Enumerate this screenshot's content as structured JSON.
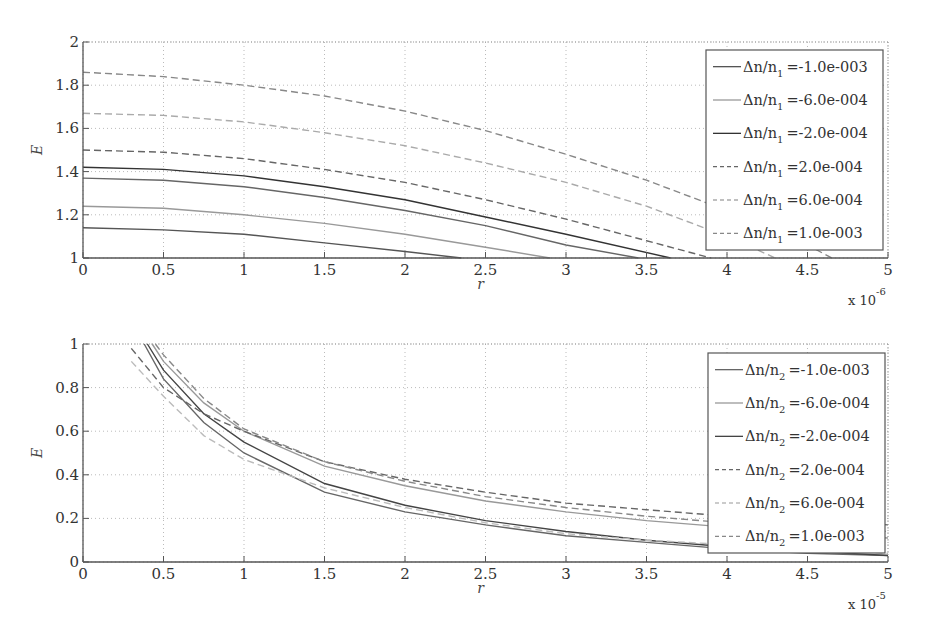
{
  "chart_data": [
    {
      "type": "line",
      "title": "",
      "xlabel": "r",
      "ylabel": "E",
      "x_multiplier": "x 10^-6",
      "x_multiplier_base": "x 10",
      "x_multiplier_exp": "-6",
      "xlim": [
        0,
        5
      ],
      "ylim": [
        1,
        2
      ],
      "xticks": [
        "0",
        "0.5",
        "1",
        "1.5",
        "2",
        "2.5",
        "3",
        "3.5",
        "4",
        "4.5",
        "5"
      ],
      "yticks": [
        "1",
        "1.2",
        "1.4",
        "1.6",
        "1.8",
        "2"
      ],
      "grid": true,
      "legend_position": "upper right",
      "series": [
        {
          "name": "Δn/n1 =-1.0e-003",
          "legend_prefix": "Δn/n",
          "legend_sub": "1",
          "legend_value": "=-1.0e-003",
          "style": "solid",
          "color": "#555555",
          "x": [
            0,
            0.5,
            1,
            1.5,
            2,
            2.35
          ],
          "y": [
            1.14,
            1.13,
            1.11,
            1.07,
            1.03,
            1.0
          ]
        },
        {
          "name": "Δn/n1 =-6.0e-004",
          "legend_prefix": "Δn/n",
          "legend_sub": "1",
          "legend_value": "=-6.0e-004",
          "style": "solid",
          "color": "#999999",
          "x": [
            0,
            0.5,
            1,
            1.5,
            2,
            2.5,
            2.9
          ],
          "y": [
            1.24,
            1.23,
            1.2,
            1.16,
            1.11,
            1.05,
            1.0
          ]
        },
        {
          "name": "Δn/n1 =-2.0e-004",
          "legend_prefix": "Δn/n",
          "legend_sub": "1",
          "legend_value": "=-2.0e-004",
          "style": "solid",
          "color": "#333333",
          "x": [
            0,
            0.5,
            1,
            1.5,
            2,
            2.5,
            3,
            3.65
          ],
          "y": [
            1.42,
            1.41,
            1.38,
            1.33,
            1.27,
            1.19,
            1.11,
            1.0
          ]
        },
        {
          "name": "Δn/n1 =2.0e-004",
          "legend_prefix": "Δn/n",
          "legend_sub": "1",
          "legend_value": "=2.0e-004",
          "style": "dashed",
          "color": "#666666",
          "x": [
            0,
            0.5,
            1,
            1.5,
            2,
            2.5,
            3,
            3.5,
            3.9
          ],
          "y": [
            1.5,
            1.49,
            1.46,
            1.41,
            1.35,
            1.27,
            1.18,
            1.08,
            1.0
          ]
        },
        {
          "name": "Δn/n1 =6.0e-004",
          "legend_prefix": "Δn/n",
          "legend_sub": "1",
          "legend_value": "=6.0e-004",
          "style": "dashed",
          "color": "#aaaaaa",
          "x": [
            0,
            0.5,
            1,
            1.5,
            2,
            2.5,
            3,
            3.5,
            4,
            4.3
          ],
          "y": [
            1.67,
            1.66,
            1.63,
            1.58,
            1.52,
            1.44,
            1.35,
            1.24,
            1.1,
            1.0
          ]
        },
        {
          "name": "Δn/n1 =1.0e-003",
          "legend_prefix": "Δn/n",
          "legend_sub": "1",
          "legend_value": "=1.0e-003",
          "style": "dashed",
          "color": "#888888",
          "x": [
            0,
            0.5,
            1,
            1.5,
            2,
            2.5,
            3,
            3.5,
            4,
            4.5,
            4.65
          ],
          "y": [
            1.86,
            1.84,
            1.8,
            1.75,
            1.68,
            1.59,
            1.48,
            1.36,
            1.22,
            1.06,
            1.0
          ]
        }
      ],
      "extra_unlabeled_series": [
        {
          "style": "solid",
          "color": "#666666",
          "x": [
            0,
            0.5,
            1,
            1.5,
            2,
            2.5,
            3,
            3.45
          ],
          "y": [
            1.37,
            1.36,
            1.33,
            1.28,
            1.22,
            1.15,
            1.06,
            1.0
          ]
        }
      ]
    },
    {
      "type": "line",
      "title": "",
      "xlabel": "r",
      "ylabel": "E",
      "x_multiplier": "x 10^-5",
      "x_multiplier_base": "x 10",
      "x_multiplier_exp": "-5",
      "xlim": [
        0,
        5
      ],
      "ylim": [
        0,
        1
      ],
      "xticks": [
        "0",
        "0.5",
        "1",
        "1.5",
        "2",
        "2.5",
        "3",
        "3.5",
        "4",
        "4.5",
        "5"
      ],
      "yticks": [
        "0",
        "0.2",
        "0.4",
        "0.6",
        "0.8",
        "1"
      ],
      "grid": true,
      "legend_position": "lower right",
      "series": [
        {
          "name": "Δn/n2 =-1.0e-003",
          "legend_prefix": "Δn/n",
          "legend_sub": "2",
          "legend_value": "=-1.0e-003",
          "style": "solid",
          "color": "#666666",
          "x": [
            0.38,
            0.5,
            0.75,
            1,
            1.5,
            2,
            2.5,
            3,
            3.5,
            4,
            4.5,
            5
          ],
          "y": [
            1.0,
            0.84,
            0.64,
            0.5,
            0.32,
            0.23,
            0.17,
            0.12,
            0.09,
            0.06,
            0.04,
            0.03
          ]
        },
        {
          "name": "Δn/n2 =-6.0e-004",
          "legend_prefix": "Δn/n",
          "legend_sub": "2",
          "legend_value": "=-6.0e-004",
          "style": "solid",
          "color": "#999999",
          "x": [
            0.43,
            0.5,
            0.75,
            1,
            1.5,
            2,
            2.5,
            3,
            3.5,
            4,
            4.5,
            5
          ],
          "y": [
            1.0,
            0.92,
            0.73,
            0.6,
            0.44,
            0.35,
            0.28,
            0.23,
            0.19,
            0.16,
            0.13,
            0.11
          ]
        },
        {
          "name": "Δn/n2 =-2.0e-004",
          "legend_prefix": "Δn/n",
          "legend_sub": "2",
          "legend_value": "=-2.0e-004",
          "style": "solid",
          "color": "#444444",
          "x": [
            0.4,
            0.5,
            0.75,
            1,
            1.5,
            2,
            2.5,
            3,
            3.5,
            4,
            4.5,
            5
          ],
          "y": [
            1.0,
            0.88,
            0.68,
            0.55,
            0.36,
            0.26,
            0.19,
            0.14,
            0.1,
            0.07,
            0.05,
            0.03
          ]
        },
        {
          "name": "Δn/n2 =2.0e-004",
          "legend_prefix": "Δn/n",
          "legend_sub": "2",
          "legend_value": "=2.0e-004",
          "style": "dashed",
          "color": "#666666",
          "x": [
            0.3,
            0.5,
            0.75,
            1,
            1.5,
            2,
            2.5,
            3,
            3.5,
            4,
            4.5,
            5
          ],
          "y": [
            0.98,
            0.8,
            0.68,
            0.6,
            0.46,
            0.38,
            0.32,
            0.27,
            0.24,
            0.21,
            0.19,
            0.17
          ]
        },
        {
          "name": "Δn/n2 =6.0e-004",
          "legend_prefix": "Δn/n",
          "legend_sub": "2",
          "legend_value": "=6.0e-004",
          "style": "dashed",
          "color": "#bbbbbb",
          "x": [
            0.3,
            0.5,
            0.75,
            1,
            1.5,
            2,
            2.5,
            3,
            3.5,
            4,
            4.5,
            5
          ],
          "y": [
            0.92,
            0.76,
            0.58,
            0.47,
            0.34,
            0.25,
            0.18,
            0.13,
            0.1,
            0.08,
            0.06,
            0.04
          ]
        },
        {
          "name": "Δn/n2 =1.0e-003",
          "legend_prefix": "Δn/n",
          "legend_sub": "2",
          "legend_value": "=1.0e-003",
          "style": "dashed",
          "color": "#888888",
          "x": [
            0.45,
            0.5,
            0.75,
            1,
            1.5,
            2,
            2.5,
            3,
            3.5,
            4,
            4.5,
            5
          ],
          "y": [
            1.0,
            0.95,
            0.75,
            0.61,
            0.46,
            0.37,
            0.3,
            0.25,
            0.21,
            0.18,
            0.16,
            0.14
          ]
        }
      ]
    }
  ]
}
